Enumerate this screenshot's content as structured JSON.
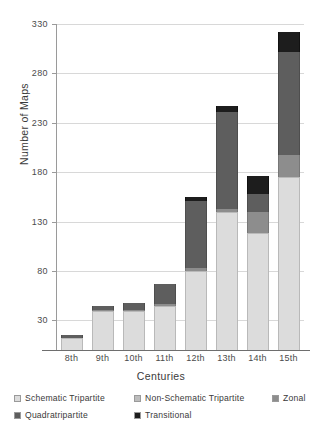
{
  "chart_data": {
    "type": "bar",
    "subtype": "stacked-bar",
    "title": "",
    "xlabel": "Centuries",
    "ylabel": "Number of Maps",
    "categories": [
      "8th",
      "9th",
      "10th",
      "11th",
      "12th",
      "13th",
      "14th",
      "15th"
    ],
    "ylim": [
      0,
      330
    ],
    "yticks": [
      30,
      80,
      130,
      180,
      230,
      280,
      330
    ],
    "grid": true,
    "legend_position": "bottom",
    "series": [
      {
        "name": "Schematic Tripartite",
        "color": "#dcdcdc",
        "values": [
          12,
          40,
          40,
          45,
          80,
          140,
          118,
          175
        ]
      },
      {
        "name": "Non-Schematic Tripartite",
        "color": "#bdbdbd",
        "values": [
          0,
          0,
          0,
          0,
          0,
          0,
          0,
          0
        ]
      },
      {
        "name": "Zonal",
        "color": "#8d8d8d",
        "values": [
          0,
          1,
          1,
          2,
          3,
          3,
          22,
          22
        ]
      },
      {
        "name": "Quadratripartite",
        "color": "#5e5e5e",
        "values": [
          3,
          4,
          7,
          20,
          68,
          98,
          18,
          105
        ]
      },
      {
        "name": "Transitional",
        "color": "#1d1d1d",
        "values": [
          0,
          0,
          0,
          0,
          4,
          6,
          18,
          20
        ]
      }
    ],
    "totals": [
      15,
      45,
      48,
      67,
      155,
      247,
      176,
      322
    ]
  },
  "axes": {
    "y_tick_labels": [
      "330",
      "280",
      "230",
      "180",
      "130",
      "80",
      "30"
    ],
    "y_title": "Number of Maps",
    "x_title": "Centuries",
    "x_tick_labels": [
      "8th",
      "9th",
      "10th",
      "11th",
      "12th",
      "13th",
      "14th",
      "15th"
    ]
  },
  "legend": {
    "rows": [
      [
        {
          "label": "Schematic Tripartite",
          "color": "#dcdcdc"
        },
        {
          "label": "Non-Schematic Tripartite",
          "color": "#bdbdbd"
        },
        {
          "label": "Zonal",
          "color": "#8d8d8d"
        }
      ],
      [
        {
          "label": "Quadratripartite",
          "color": "#5e5e5e"
        },
        {
          "label": "Transitional",
          "color": "#1d1d1d"
        }
      ]
    ]
  }
}
